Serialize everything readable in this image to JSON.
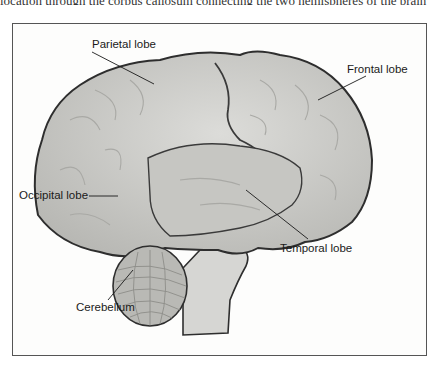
{
  "caption_fragment": "location through the corpus callosum connecting the two hemispheres of the brain",
  "diagram": {
    "labels": [
      {
        "id": "parietal",
        "text": "Parietal lobe"
      },
      {
        "id": "frontal",
        "text": "Frontal lobe"
      },
      {
        "id": "occipital",
        "text": "Occipital lobe"
      },
      {
        "id": "temporal",
        "text": "Temporal lobe"
      },
      {
        "id": "cerebellum",
        "text": "Cerebellum"
      }
    ]
  },
  "colors": {
    "brain_fill": "#cfcfcc",
    "brain_outline": "#2e2e2e",
    "temporal_fill": "#c6c6c2",
    "cerebellum_fill": "#b9b9b5",
    "brainstem_fill": "#d6d6d3",
    "frame_border": "#555555",
    "label_text": "#1a1a1a"
  }
}
